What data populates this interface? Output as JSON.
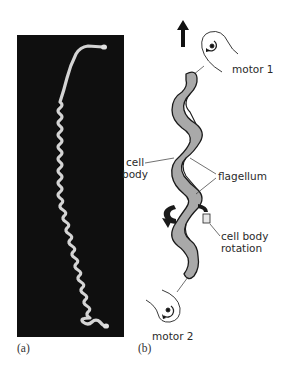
{
  "figure": {
    "panel_a": {
      "label": "(a)",
      "description": "micrograph of helical spirochete cell"
    },
    "panel_b": {
      "label": "(b)",
      "labels": {
        "motor_top": "motor 1",
        "motor_bottom": "motor 2",
        "cell_body": [
          "cell",
          "body"
        ],
        "flagellum": "flagellum",
        "rotation": [
          "cell body",
          "rotation"
        ]
      },
      "icons": [
        "up-arrow-icon",
        "motor-icon",
        "rotation-arrow-icon"
      ]
    },
    "colors": {
      "micrograph_bg": "#0f0f0f",
      "cell_fill": "#a9a9a9",
      "outline": "#1a1a1a",
      "cell_in_micrograph": "#d6d6d6"
    }
  }
}
